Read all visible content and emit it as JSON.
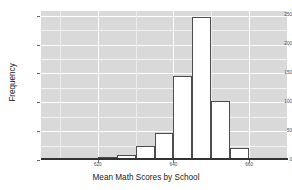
{
  "chart_data": {
    "type": "bar",
    "title": "",
    "xlabel": "Mean Math Scores by School",
    "ylabel": "Frequency",
    "xlim": [
      605,
      670
    ],
    "ylim": [
      0,
      258
    ],
    "grid": true,
    "legend": null,
    "bin_width": 5,
    "categories": [
      "605-610",
      "610-615",
      "615-620",
      "620-625",
      "625-630",
      "630-635",
      "635-640",
      "640-645",
      "645-650",
      "650-655",
      "655-660",
      "660-665",
      "665-670"
    ],
    "bin_starts": [
      605,
      610,
      615,
      620,
      625,
      630,
      635,
      640,
      645,
      650,
      655,
      660,
      665
    ],
    "values": [
      1,
      2,
      4,
      5,
      9,
      25,
      47,
      145,
      248,
      103,
      21,
      0,
      0
    ],
    "xticks": [
      620,
      640,
      660
    ],
    "xtick_labels": [
      "620",
      "640",
      "660"
    ],
    "yticks": [
      0,
      50,
      100,
      150,
      200,
      250
    ],
    "ytick_labels": [
      "0",
      "50",
      "100",
      "150",
      "200",
      "250"
    ]
  },
  "style": {
    "panel_background": "#d9d9d9",
    "gridline_color": "#ffffff",
    "bar_fill": "#ffffff",
    "bar_stroke": "#4d4d4d",
    "axis_color": "#333333",
    "text_color": "#1a1a1a",
    "tick_text_color": "#4a4a4a"
  }
}
